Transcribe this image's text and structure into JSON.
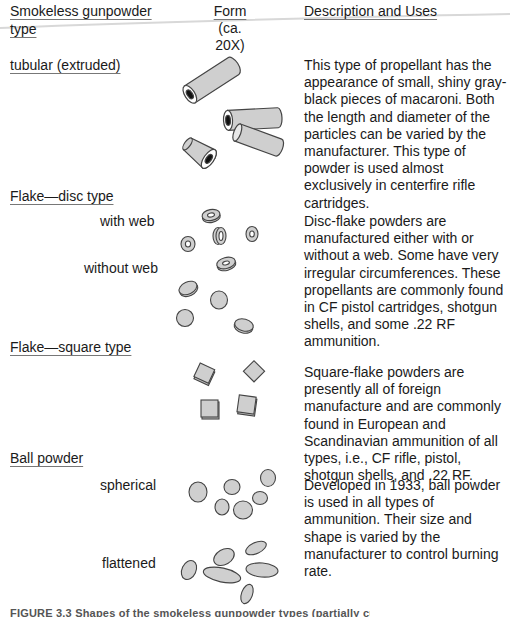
{
  "header": {
    "col1_line1": "Smokeless gunpowder",
    "col1_line2": "type",
    "col2_line1": "Form",
    "col2_line2": "(ca.",
    "col2_line3": "20X)",
    "col3": "Description and Uses"
  },
  "sections": [
    {
      "type": "tubular (extruded)",
      "subtypes": [],
      "description": "This type of propellant has the appearance of small, shiny gray-black pieces of macaroni. Both the length and diameter of the particles can be varied by the manufacturer. This type of powder is used almost exclusively in centerfire rifle cartridges."
    },
    {
      "type": "Flake—disc type",
      "subtypes": [
        "with web",
        "without web"
      ],
      "description": "Disc-flake powders are manufactured either with or without a web. Some have very irregular circumferences. These propellants are commonly found in CF pistol cartridges, shotgun shells, and some .22 RF ammunition."
    },
    {
      "type": "Flake—square type",
      "subtypes": [],
      "description": "Square-flake powders are presently all of foreign manufacture and are commonly found in European and Scandinavian ammunition of all types, i.e., CF rifle, pistol, shotgun shells, and .22 RF."
    },
    {
      "type": "Ball powder",
      "subtypes": [
        "spherical",
        "flattened"
      ],
      "description": "Developed in 1933, ball powder is used in all types of ammunition. Their size and shape is varied by the manufacturer to control burning rate."
    }
  ],
  "caption": "FIGURE 3.3  Shapes of the smokeless gunpowder types (partially cut off)",
  "colors": {
    "grain_fill": "#cfcfcf",
    "grain_stroke": "#444444",
    "hole": "#111111",
    "text": "#1a1a1a"
  }
}
